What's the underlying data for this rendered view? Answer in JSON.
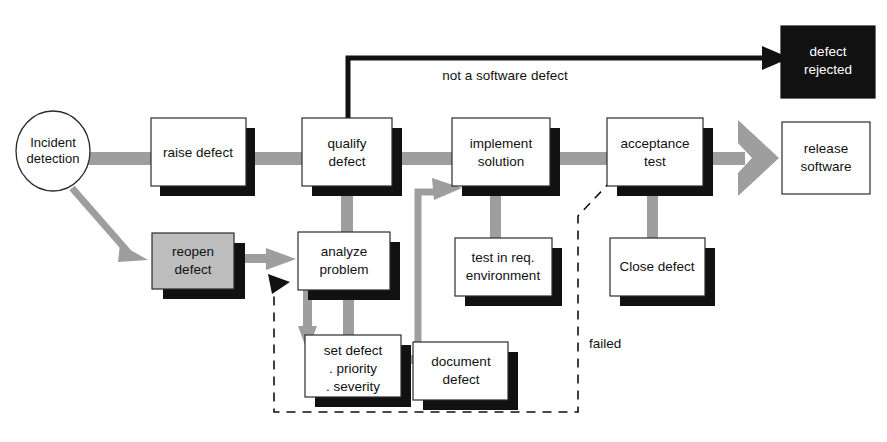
{
  "diagram": {
    "colors": {
      "background": "#ffffff",
      "shadow": "#111111",
      "flow_arrow": "#9e9e9e",
      "node_fill": "#ffffff",
      "node_fill_gray": "#bdbdbd",
      "node_fill_black": "#111111",
      "stroke": "#2b2b2b",
      "black_arrow": "#111111"
    },
    "start": {
      "label_line1": "Incident",
      "label_line2": "detection"
    },
    "nodes": [
      {
        "id": "raise-defect",
        "label_line1": "raise defect",
        "label_line2": "",
        "style": "white"
      },
      {
        "id": "qualify-defect",
        "label_line1": "qualify",
        "label_line2": "defect",
        "style": "white"
      },
      {
        "id": "implement-solution",
        "label_line1": "implement",
        "label_line2": "solution",
        "style": "white"
      },
      {
        "id": "acceptance-test",
        "label_line1": "acceptance",
        "label_line2": "test",
        "style": "white"
      },
      {
        "id": "defect-rejected",
        "label_line1": "defect",
        "label_line2": "rejected",
        "style": "black"
      },
      {
        "id": "release-software",
        "label_line1": "release",
        "label_line2": "software",
        "style": "white"
      },
      {
        "id": "reopen-defect",
        "label_line1": "reopen",
        "label_line2": "defect",
        "style": "gray"
      },
      {
        "id": "analyze-problem",
        "label_line1": "analyze",
        "label_line2": "problem",
        "style": "white"
      },
      {
        "id": "test-in-req-env",
        "label_line1": "test in req.",
        "label_line2": "environment",
        "style": "white"
      },
      {
        "id": "close-defect",
        "label_line1": "Close defect",
        "label_line2": "",
        "style": "white"
      },
      {
        "id": "set-defect",
        "label_line1": "set defect",
        "label_line2": ". priority",
        "label_line3": ". severity",
        "style": "white"
      },
      {
        "id": "document-defect",
        "label_line1": "document",
        "label_line2": "defect",
        "style": "white"
      }
    ],
    "edge_labels": [
      {
        "id": "not-a-software-defect",
        "text": "not a software defect"
      },
      {
        "id": "failed",
        "text": "failed"
      }
    ]
  }
}
